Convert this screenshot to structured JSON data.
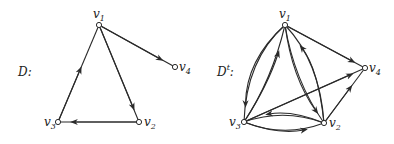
{
  "graphs": [
    {
      "name": "D",
      "label": "D:",
      "label_main": "D",
      "label_sup": "",
      "label_colon": ":",
      "nodes": [
        {
          "id": "v1",
          "label": "v",
          "sub": "1"
        },
        {
          "id": "v2",
          "label": "v",
          "sub": "2"
        },
        {
          "id": "v3",
          "label": "v",
          "sub": "3"
        },
        {
          "id": "v4",
          "label": "v",
          "sub": "4"
        }
      ],
      "edges": [
        {
          "from": "v3",
          "to": "v1"
        },
        {
          "from": "v1",
          "to": "v2"
        },
        {
          "from": "v2",
          "to": "v3"
        },
        {
          "from": "v1",
          "to": "v4"
        }
      ]
    },
    {
      "name": "D^t",
      "label": "D^t:",
      "label_main": "D",
      "label_sup": "t",
      "label_colon": ":",
      "nodes": [
        {
          "id": "v1",
          "label": "v",
          "sub": "1"
        },
        {
          "id": "v2",
          "label": "v",
          "sub": "2"
        },
        {
          "id": "v3",
          "label": "v",
          "sub": "3"
        },
        {
          "id": "v4",
          "label": "v",
          "sub": "4"
        }
      ],
      "edges": [
        {
          "from": "v1",
          "to": "v3"
        },
        {
          "from": "v3",
          "to": "v1"
        },
        {
          "from": "v1",
          "to": "v2"
        },
        {
          "from": "v2",
          "to": "v1"
        },
        {
          "from": "v1",
          "to": "v4"
        },
        {
          "from": "v3",
          "to": "v4"
        },
        {
          "from": "v2",
          "to": "v4"
        },
        {
          "from": "v2",
          "to": "v3"
        },
        {
          "from": "v3",
          "to": "v2"
        }
      ]
    }
  ]
}
